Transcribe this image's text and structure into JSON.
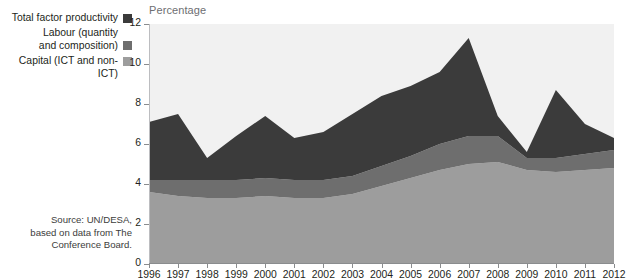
{
  "legend": {
    "items": [
      {
        "label": "Total factor productivity",
        "color": "#3b3b3b",
        "icon": "legend-swatch-icon"
      },
      {
        "label": "Labour (quantity\nand composition)",
        "color": "#6e6e6e",
        "icon": "legend-swatch-icon"
      },
      {
        "label": "Capital (ICT and non-ICT)",
        "color": "#9d9d9d",
        "icon": "legend-swatch-icon"
      }
    ]
  },
  "source": {
    "text": "Source:  UN/DESA,\nbased on data from The\nConference Board."
  },
  "chart_data": {
    "type": "area",
    "stacked": true,
    "title": "Percentage",
    "subtitle": "",
    "xlabel": "",
    "ylabel": "Percentage",
    "ylim": [
      0,
      12
    ],
    "yticks": [
      0,
      2,
      4,
      6,
      8,
      10,
      12
    ],
    "grid": false,
    "legend_position": "left",
    "plot_background": "#f1f1f1",
    "categories": [
      "1996",
      "1997",
      "1998",
      "1999",
      "2000",
      "2001",
      "2002",
      "2003",
      "2004",
      "2005",
      "2006",
      "2007",
      "2008",
      "2009",
      "2010",
      "2011",
      "2012"
    ],
    "series": [
      {
        "name": "Capital (ICT and non-ICT)",
        "color": "#9d9d9d",
        "values": [
          3.6,
          3.4,
          3.3,
          3.3,
          3.4,
          3.3,
          3.3,
          3.5,
          3.9,
          4.3,
          4.7,
          5.0,
          5.1,
          4.7,
          4.6,
          4.7,
          4.8
        ]
      },
      {
        "name": "Labour (quantity and composition)",
        "color": "#6e6e6e",
        "values": [
          0.6,
          0.8,
          0.9,
          0.9,
          0.9,
          0.9,
          0.9,
          0.9,
          1.0,
          1.1,
          1.3,
          1.4,
          1.3,
          0.6,
          0.7,
          0.8,
          0.9
        ]
      },
      {
        "name": "Total factor productivity",
        "color": "#3b3b3b",
        "values": [
          2.9,
          3.3,
          1.1,
          2.2,
          3.1,
          2.1,
          2.4,
          3.1,
          3.5,
          3.5,
          3.6,
          4.9,
          1.0,
          0.3,
          3.4,
          1.5,
          0.6
        ]
      }
    ],
    "totals": [
      7.1,
      7.5,
      5.3,
      6.4,
      7.4,
      6.3,
      6.6,
      7.5,
      8.4,
      8.9,
      9.6,
      11.3,
      7.4,
      5.6,
      8.7,
      7.0,
      6.3
    ]
  }
}
